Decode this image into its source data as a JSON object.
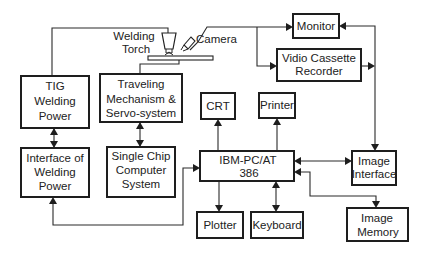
{
  "diagram": {
    "colors": {
      "stroke": "#1e1e1e",
      "text": "#222222",
      "background": "#ffffff"
    },
    "labels": {
      "welding_torch": [
        "Welding",
        "Torch"
      ],
      "camera": "Camera"
    },
    "boxes": {
      "tig_power": [
        "TIG",
        "Welding",
        "Power"
      ],
      "traveling": [
        "Traveling",
        "Mechanism &",
        "Servo-system"
      ],
      "interface_welding": [
        "Interface of",
        "Welding",
        "Power"
      ],
      "single_chip": [
        "Single Chip",
        "Computer",
        "System"
      ],
      "monitor": [
        "Monitor"
      ],
      "vcr": [
        "Vidio Cassette",
        "Recorder"
      ],
      "crt": [
        "CRT"
      ],
      "printer": [
        "Printer"
      ],
      "ibm": [
        "IBM-PC/AT",
        "386"
      ],
      "image_interface": [
        "Image",
        "Interface"
      ],
      "plotter": [
        "Plotter"
      ],
      "keyboard": [
        "Keyboard"
      ],
      "image_memory": [
        "Image",
        "Memory"
      ]
    },
    "connections": [
      {
        "from": "tig_power",
        "to": "welding_torch",
        "type": "line"
      },
      {
        "from": "traveling",
        "to": "torch_plate",
        "type": "line"
      },
      {
        "from": "camera",
        "to": "monitor",
        "type": "arrow"
      },
      {
        "from": "camera",
        "to": "vcr",
        "type": "arrow"
      },
      {
        "from": "image_interface",
        "to": "monitor",
        "type": "arrow"
      },
      {
        "from": "vcr",
        "to": "image_interface_bus",
        "type": "arrow"
      },
      {
        "from": "tig_power",
        "to": "interface_welding",
        "type": "bidirectional"
      },
      {
        "from": "traveling",
        "to": "single_chip",
        "type": "bidirectional"
      },
      {
        "from": "ibm",
        "to": "crt",
        "type": "arrow"
      },
      {
        "from": "ibm",
        "to": "printer",
        "type": "arrow"
      },
      {
        "from": "ibm",
        "to": "plotter",
        "type": "arrow"
      },
      {
        "from": "ibm",
        "to": "keyboard",
        "type": "bidirectional"
      },
      {
        "from": "ibm",
        "to": "image_interface",
        "type": "bidirectional"
      },
      {
        "from": "ibm",
        "to": "image_memory",
        "type": "bidirectional"
      },
      {
        "from": "ibm_loop",
        "to": "interface_welding",
        "type": "arrow"
      }
    ]
  }
}
